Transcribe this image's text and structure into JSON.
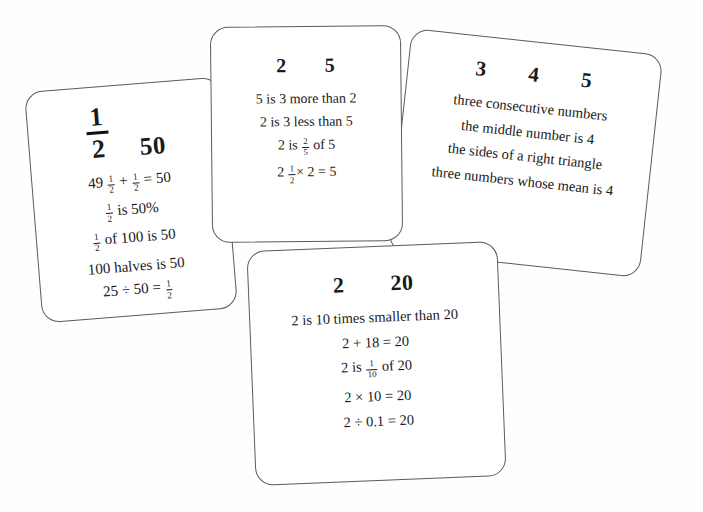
{
  "page": {
    "background_color": "#ffffff",
    "card_border_color": "#5a5a60",
    "text_color": "#1a1a1a"
  },
  "cards": [
    {
      "id": "half-fifty",
      "header": [
        "1/2",
        "50"
      ],
      "header_display": {
        "fraction_numerator": "1",
        "fraction_denominator": "2",
        "second": "50"
      },
      "lines": [
        "49 1/2 + 1/2 = 50",
        "1/2 is 50%",
        "1/2 of 100 is 50",
        "100 halves is 50",
        "25 ÷ 50 = 1/2"
      ],
      "line_parts": [
        [
          {
            "t": "text",
            "v": "49 "
          },
          {
            "t": "frac",
            "n": "1",
            "d": "2"
          },
          {
            "t": "text",
            "v": " + "
          },
          {
            "t": "frac",
            "n": "1",
            "d": "2"
          },
          {
            "t": "text",
            "v": " = 50"
          }
        ],
        [
          {
            "t": "frac",
            "n": "1",
            "d": "2"
          },
          {
            "t": "text",
            "v": " is 50%"
          }
        ],
        [
          {
            "t": "frac",
            "n": "1",
            "d": "2"
          },
          {
            "t": "text",
            "v": " of 100 is 50"
          }
        ],
        [
          {
            "t": "text",
            "v": "100 halves is 50"
          }
        ],
        [
          {
            "t": "text",
            "v": "25 ÷ 50 = "
          },
          {
            "t": "frac",
            "n": "1",
            "d": "2"
          }
        ]
      ]
    },
    {
      "id": "two-five",
      "header": [
        "2",
        "5"
      ],
      "lines": [
        "5 is 3 more than 2",
        "2 is 3 less than 5",
        "2 is 2/5 of 5",
        "2 1/2 × 2 = 5"
      ],
      "line_parts": [
        [
          {
            "t": "text",
            "v": "5 is 3 more than 2"
          }
        ],
        [
          {
            "t": "text",
            "v": "2 is 3 less than 5"
          }
        ],
        [
          {
            "t": "text",
            "v": "2 is "
          },
          {
            "t": "frac",
            "n": "2",
            "d": "5"
          },
          {
            "t": "text",
            "v": " of 5"
          }
        ],
        [
          {
            "t": "text",
            "v": "2 "
          },
          {
            "t": "frac",
            "n": "1",
            "d": "2"
          },
          {
            "t": "text",
            "v": "× 2 = 5"
          }
        ]
      ]
    },
    {
      "id": "three-four-five",
      "header": [
        "3",
        "4",
        "5"
      ],
      "lines": [
        "three consecutive numbers",
        "the middle number is 4",
        "the sides of a right triangle",
        "three numbers whose mean is 4"
      ],
      "line_parts": [
        [
          {
            "t": "text",
            "v": "three consecutive numbers"
          }
        ],
        [
          {
            "t": "text",
            "v": "the middle number is 4"
          }
        ],
        [
          {
            "t": "text",
            "v": "the sides of a right triangle"
          }
        ],
        [
          {
            "t": "text",
            "v": "three numbers whose mean is 4"
          }
        ]
      ]
    },
    {
      "id": "two-twenty",
      "header": [
        "2",
        "20"
      ],
      "lines": [
        "2 is 10 times smaller than 20",
        "2 + 18 = 20",
        "2 is 1/10 of 20",
        "2 × 10 = 20",
        "2 ÷ 0.1 = 20"
      ],
      "line_parts": [
        [
          {
            "t": "text",
            "v": "2 is 10 times smaller than 20"
          }
        ],
        [
          {
            "t": "text",
            "v": "2 + 18 = 20"
          }
        ],
        [
          {
            "t": "text",
            "v": "2 is "
          },
          {
            "t": "frac",
            "n": "1",
            "d": "10"
          },
          {
            "t": "text",
            "v": " of 20"
          }
        ],
        [
          {
            "t": "text",
            "v": "2 ×  10 = 20"
          }
        ],
        [
          {
            "t": "text",
            "v": "2 ÷ 0.1 = 20"
          }
        ]
      ]
    }
  ]
}
